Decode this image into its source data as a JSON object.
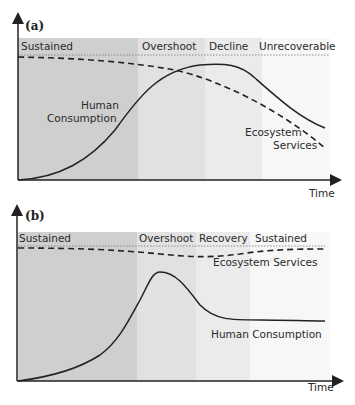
{
  "figure": {
    "panel_a": {
      "label": "(a)",
      "phases": [
        "Sustained",
        "Overshoot",
        "Decline",
        "Unrecoverable"
      ],
      "curve_labels": {
        "human_1": "Human",
        "human_2": "Consumption",
        "eco_1": "Ecosystem",
        "eco_2": "Services"
      },
      "x_axis_label": "Time",
      "colors": {
        "phase1": "#cfcfcf",
        "phase2": "#e2e2e2",
        "phase3": "#ececec",
        "phase4": "#f7f7f7"
      }
    },
    "panel_b": {
      "label": "(b)",
      "phases": [
        "Sustained",
        "Overshoot",
        "Recovery",
        "Sustained"
      ],
      "curve_labels": {
        "eco": "Ecosystem Services",
        "human": "Human Consumption"
      },
      "x_axis_label": "Time",
      "colors": {
        "phase1": "#cfcfcf",
        "phase2": "#e2e2e2",
        "phase3": "#ececec",
        "phase4": "#f7f7f7"
      }
    }
  }
}
